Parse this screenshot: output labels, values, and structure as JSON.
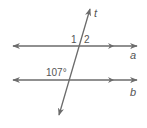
{
  "diagram": {
    "type": "parallel-lines-transversal",
    "colors": {
      "line": "#6b6b6b",
      "text": "#555555",
      "background": "#ffffff"
    },
    "lines": [
      {
        "id": "a",
        "label": "a"
      },
      {
        "id": "b",
        "label": "b"
      },
      {
        "id": "t",
        "label": "t"
      }
    ],
    "angles": [
      {
        "id": "angle-1",
        "label": "1"
      },
      {
        "id": "angle-2",
        "label": "2"
      },
      {
        "id": "angle-107",
        "label": "107°"
      }
    ]
  }
}
